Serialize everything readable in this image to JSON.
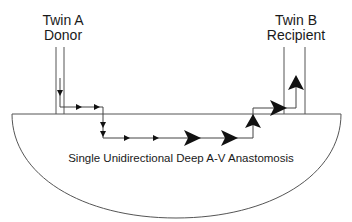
{
  "twin_a": {
    "line1": "Twin A",
    "line2": "Donor"
  },
  "twin_b": {
    "line1": "Twin B",
    "line2": "Recipient"
  },
  "caption": "Single Unidirectional Deep A-V Anastomosis",
  "colors": {
    "stroke": "#555555",
    "arrow": "#111111",
    "text": "#1a1a1a",
    "background": "#ffffff"
  }
}
